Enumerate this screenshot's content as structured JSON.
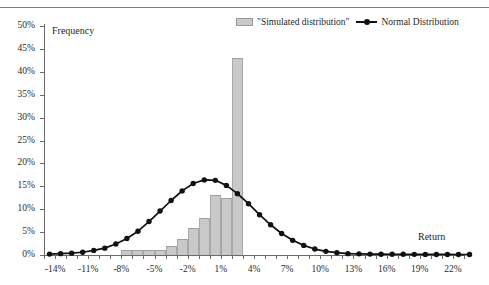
{
  "legend": {
    "simulated_label": "\"Simulated distribution\"",
    "normal_label": "Normal Distribution",
    "bar_color": "#c9c9c9",
    "line_color": "#111111"
  },
  "axis_titles": {
    "y": "Frequency",
    "x": "Return"
  },
  "chart_data": {
    "type": "bar",
    "title": "",
    "xlabel": "Return",
    "ylabel": "Frequency",
    "xlim": [
      -15,
      23
    ],
    "ylim": [
      0,
      50
    ],
    "grid": false,
    "legend_position": "top-right",
    "y_ticks": [
      "0%",
      "5%",
      "10%",
      "15%",
      "20%",
      "25%",
      "30%",
      "35%",
      "40%",
      "45%",
      "50%"
    ],
    "y_tick_values": [
      0,
      5,
      10,
      15,
      20,
      25,
      30,
      35,
      40,
      45,
      50
    ],
    "x_tick_labels": [
      "-14%",
      "-11%",
      "-8%",
      "-5%",
      "-2%",
      "1%",
      "4%",
      "7%",
      "10%",
      "13%",
      "16%",
      "19%",
      "22%"
    ],
    "x_tick_values": [
      -14,
      -11,
      -8,
      -5,
      -2,
      1,
      4,
      7,
      10,
      13,
      16,
      19,
      22
    ],
    "x_minor_tick_values": [
      -15,
      -14,
      -13,
      -12,
      -11,
      -10,
      -9,
      -8,
      -7,
      -6,
      -5,
      -4,
      -3,
      -2,
      -1,
      0,
      1,
      2,
      3,
      4,
      5,
      6,
      7,
      8,
      9,
      10,
      11,
      12,
      13,
      14,
      15,
      16,
      17,
      18,
      19,
      20,
      21,
      22,
      23
    ],
    "categories": [
      -15,
      -14,
      -13,
      -12,
      -11,
      -10,
      -9,
      -8,
      -7,
      -6,
      -5,
      -4,
      -3,
      -2,
      -1,
      0,
      1,
      2,
      3,
      4,
      5,
      6,
      7,
      8,
      9,
      10,
      11,
      12,
      13,
      14,
      15,
      16,
      17,
      18,
      19,
      20,
      21,
      22,
      23
    ],
    "series": [
      {
        "name": "\"Simulated distribution\"",
        "type": "bar",
        "values": [
          0,
          0,
          0,
          0,
          0,
          0,
          0,
          1.2,
          1.2,
          1.2,
          1.2,
          2.0,
          3.5,
          6.0,
          8.0,
          13.0,
          12.5,
          43.0,
          0,
          0,
          0,
          0,
          0,
          0,
          0,
          0,
          0,
          0,
          0,
          0,
          0,
          0,
          0,
          0,
          0,
          0,
          0,
          0,
          0
        ]
      },
      {
        "name": "Normal Distribution",
        "type": "line",
        "values": [
          0.2,
          0.3,
          0.4,
          0.6,
          1.0,
          1.5,
          2.4,
          3.6,
          5.2,
          7.3,
          9.6,
          11.9,
          14.0,
          15.6,
          16.4,
          16.3,
          15.2,
          13.4,
          11.2,
          8.8,
          6.6,
          4.7,
          3.2,
          2.1,
          1.3,
          0.8,
          0.5,
          0.3,
          0.25,
          0.2,
          0.18,
          0.16,
          0.15,
          0.14,
          0.13,
          0.12,
          0.12,
          0.11,
          0.1
        ]
      }
    ]
  }
}
